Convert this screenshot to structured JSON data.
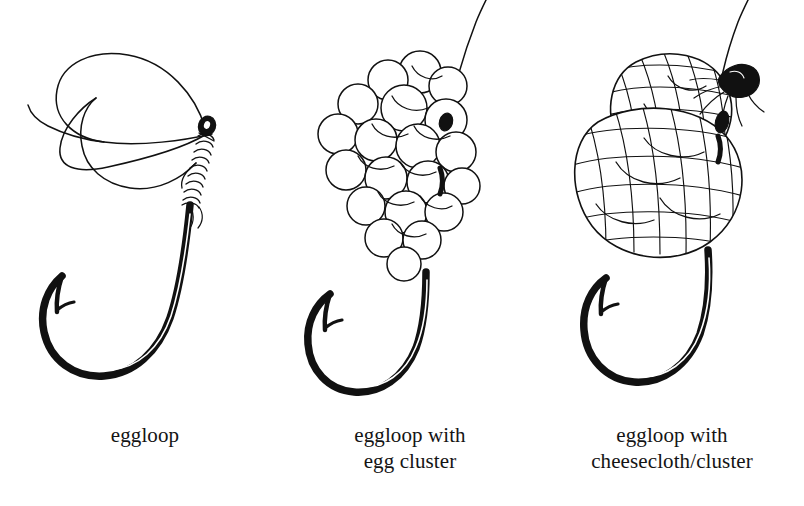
{
  "document": {
    "type": "line-drawing-diagram",
    "subject": "fishing egg loop knot stages",
    "background_color": "#ffffff",
    "ink_color": "#111111"
  },
  "panels": [
    {
      "id": "eggloop",
      "caption_lines": [
        "eggloop"
      ],
      "parts": [
        {
          "name": "monofilament-loop",
          "label": "eggloop"
        },
        {
          "name": "tag-end",
          "label": "tag end"
        },
        {
          "name": "wrapped-shank-knot",
          "label": "wraps"
        },
        {
          "name": "hook-eye",
          "label": "hook eye"
        },
        {
          "name": "hook-shank",
          "label": "shank"
        },
        {
          "name": "hook-bend",
          "label": "bend"
        },
        {
          "name": "hook-point",
          "label": "point"
        },
        {
          "name": "hook-barb",
          "label": "barb"
        }
      ]
    },
    {
      "id": "eggloop-with-egg-cluster",
      "caption_lines": [
        "eggloop with",
        "egg cluster"
      ],
      "parts": [
        {
          "name": "egg-cluster",
          "label": "egg cluster"
        },
        {
          "name": "standing-line",
          "label": "standing line"
        },
        {
          "name": "hook-eye",
          "label": "hook eye"
        },
        {
          "name": "hook-shank",
          "label": "shank"
        },
        {
          "name": "hook-bend",
          "label": "bend"
        },
        {
          "name": "hook-point",
          "label": "point"
        },
        {
          "name": "hook-barb",
          "label": "barb"
        }
      ],
      "egg_count_visible": 26
    },
    {
      "id": "eggloop-with-cheesecloth-cluster",
      "caption_lines": [
        "eggloop with",
        "cheesecloth/cluster"
      ],
      "parts": [
        {
          "name": "cheesecloth-wrapped-cluster",
          "label": "cheesecloth/cluster"
        },
        {
          "name": "cheesecloth-mesh",
          "label": "mesh weave"
        },
        {
          "name": "cheesecloth-tie-off",
          "label": "tie-off"
        },
        {
          "name": "standing-line",
          "label": "standing line"
        },
        {
          "name": "hook-eye",
          "label": "hook eye"
        },
        {
          "name": "hook-shank",
          "label": "shank"
        },
        {
          "name": "hook-bend",
          "label": "bend"
        },
        {
          "name": "hook-point",
          "label": "point"
        },
        {
          "name": "hook-barb",
          "label": "barb"
        }
      ]
    }
  ]
}
